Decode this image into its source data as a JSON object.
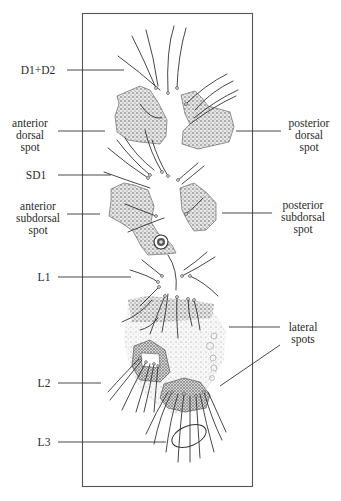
{
  "figure": {
    "type": "anatomical-diagram"
  },
  "labels_left": [
    {
      "id": "d1-d2",
      "lines": [
        "D1+D2"
      ]
    },
    {
      "id": "anterior-dorsal-spot",
      "lines": [
        "anterior",
        "dorsal",
        "spot"
      ]
    },
    {
      "id": "sd1",
      "lines": [
        "SD1"
      ]
    },
    {
      "id": "anterior-subdorsal-spot",
      "lines": [
        "anterior",
        "subdorsal",
        "spot"
      ]
    },
    {
      "id": "l1",
      "lines": [
        "L1"
      ]
    },
    {
      "id": "l2",
      "lines": [
        "L2"
      ]
    },
    {
      "id": "l3",
      "lines": [
        "L3"
      ]
    }
  ],
  "labels_right": [
    {
      "id": "posterior-dorsal-spot",
      "lines": [
        "posterior",
        "dorsal",
        "spot"
      ]
    },
    {
      "id": "posterior-subdorsal-spot",
      "lines": [
        "posterior",
        "subdorsal",
        "spot"
      ]
    },
    {
      "id": "lateral-spots",
      "lines": [
        "lateral",
        "spots"
      ]
    }
  ],
  "colors": {
    "ink": "#2a2a2a",
    "frame": "#555555",
    "stipple": "#6b6b6b",
    "background": "#ffffff"
  }
}
